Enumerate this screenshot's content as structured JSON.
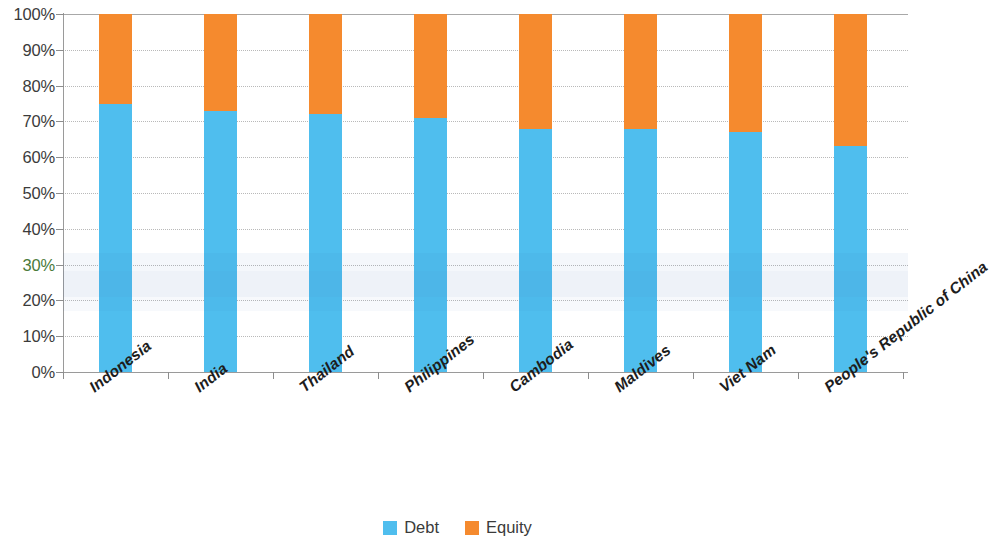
{
  "chart_data": {
    "type": "bar",
    "subtype": "stacked-percentage",
    "title": "",
    "xlabel": "",
    "ylabel": "",
    "ylim": [
      0,
      100
    ],
    "grid": true,
    "legend_position": "bottom-center",
    "categories": [
      "Indonesia",
      "India",
      "Thailand",
      "Philippines",
      "Cambodia",
      "Maldives",
      "Viet Nam",
      "People's Republic of China"
    ],
    "series": [
      {
        "name": "Debt",
        "color": "#4fbeee",
        "values": [
          75,
          73,
          72,
          71,
          68,
          68,
          67,
          63
        ]
      },
      {
        "name": "Equity",
        "color": "#f58a2e",
        "values": [
          25,
          27,
          28,
          29,
          32,
          32,
          33,
          37
        ]
      }
    ],
    "ytick_labels": [
      "0%",
      "10%",
      "20%",
      "30%",
      "40%",
      "50%",
      "60%",
      "70%",
      "80%",
      "90%",
      "100%"
    ],
    "ytick_values": [
      0,
      10,
      20,
      30,
      40,
      50,
      60,
      70,
      80,
      90,
      100
    ]
  },
  "legend": {
    "items": [
      {
        "label": "Debt",
        "color": "#4fbeee"
      },
      {
        "label": "Equity",
        "color": "#f58a2e"
      }
    ]
  }
}
